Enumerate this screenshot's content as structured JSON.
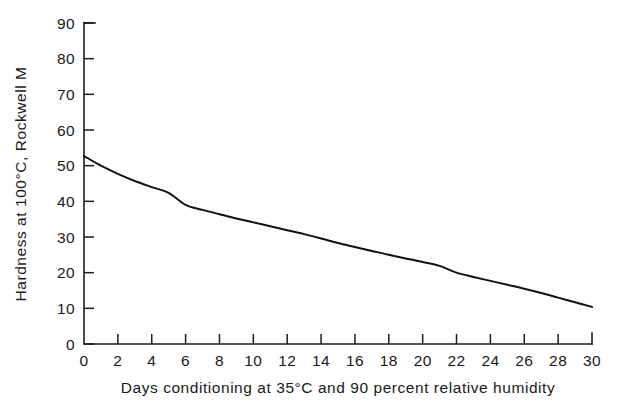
{
  "chart_data": {
    "type": "line",
    "title": "",
    "xlabel": "Days conditioning at 35°C and 90 percent relative humidity",
    "ylabel": "Hardness at 100°C, Rockwell M",
    "xlim": [
      0,
      30
    ],
    "ylim": [
      0,
      90
    ],
    "xticks": [
      0,
      2,
      4,
      6,
      8,
      10,
      12,
      14,
      16,
      18,
      20,
      22,
      24,
      26,
      28,
      30
    ],
    "yticks": [
      0,
      10,
      20,
      30,
      40,
      50,
      60,
      70,
      80,
      90
    ],
    "xtick_labels": [
      "0",
      "2",
      "4",
      "6",
      "8",
      "10",
      "12",
      "14",
      "16",
      "18",
      "20",
      "22",
      "24",
      "26",
      "28",
      "30"
    ],
    "ytick_labels": [
      "0",
      "10",
      "20",
      "30",
      "40",
      "50",
      "60",
      "70",
      "80",
      "90"
    ],
    "grid": false,
    "legend": null,
    "line_color": "#111111",
    "series": [
      {
        "name": "Hardness decay",
        "x": [
          0,
          1,
          2,
          3,
          4,
          5,
          6,
          7,
          8,
          9,
          10,
          11,
          12,
          13,
          14,
          15,
          16,
          17,
          18,
          19,
          20,
          21,
          22,
          23,
          24,
          25,
          26,
          27,
          28,
          29,
          30
        ],
        "values": [
          52.7,
          50.0,
          47.7,
          45.7,
          44.0,
          42.4,
          39.0,
          37.6,
          36.4,
          35.2,
          34.1,
          33.0,
          31.9,
          30.8,
          29.6,
          28.3,
          27.2,
          26.1,
          25.0,
          24.0,
          23.0,
          21.9,
          20.0,
          18.8,
          17.7,
          16.6,
          15.5,
          14.3,
          13.0,
          11.7,
          10.4
        ]
      }
    ]
  },
  "axes": {
    "y_title": "Hardness at 100°C, Rockwell M",
    "x_title": "Days conditioning at 35°C and 90 percent relative humidity"
  }
}
